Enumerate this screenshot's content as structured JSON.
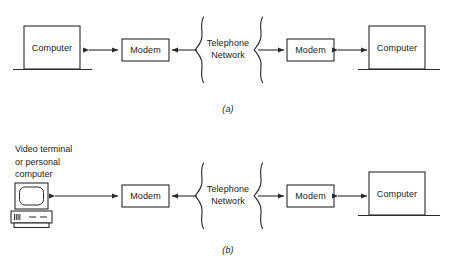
{
  "figure": {
    "line_color": "#2b2b2b",
    "background_color": "#ffffff"
  },
  "panels": [
    {
      "id": "panel-a",
      "caption": "(a)",
      "left_node": {
        "type": "computer",
        "label": "Computer"
      },
      "left_modem": {
        "label": "Modem"
      },
      "network": {
        "label_line1": "Telephone",
        "label_line2": "Network"
      },
      "right_modem": {
        "label": "Modem"
      },
      "right_node": {
        "type": "computer",
        "label": "Computer"
      },
      "arrows": [
        {
          "name": "left-node-to-modem",
          "direction": "bidirectional"
        },
        {
          "name": "network-to-left-modem",
          "direction": "left"
        },
        {
          "name": "network-to-right-modem",
          "direction": "right"
        },
        {
          "name": "right-modem-to-node",
          "direction": "bidirectional"
        }
      ]
    },
    {
      "id": "panel-b",
      "caption": "(b)",
      "left_node": {
        "type": "video-terminal",
        "label": "Video terminal\nor personal\ncomputer"
      },
      "left_modem": {
        "label": "Modem"
      },
      "network": {
        "label_line1": "Telephone",
        "label_line2": "Network"
      },
      "right_modem": {
        "label": "Modem"
      },
      "right_node": {
        "type": "computer",
        "label": "Computer"
      },
      "arrows": [
        {
          "name": "left-node-to-modem",
          "direction": "bidirectional"
        },
        {
          "name": "network-to-left-modem",
          "direction": "left"
        },
        {
          "name": "network-to-right-modem",
          "direction": "right"
        },
        {
          "name": "right-modem-to-node",
          "direction": "bidirectional"
        }
      ]
    }
  ]
}
